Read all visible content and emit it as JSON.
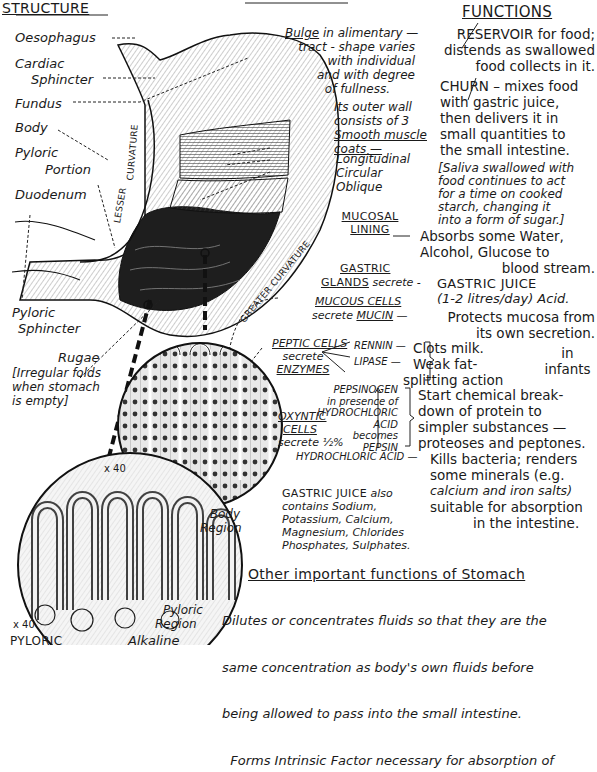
{
  "headings": {
    "structure": "STRUCTURE",
    "functions": "FUNCTIONS"
  },
  "structure_labels": {
    "oesophagus": "Oesophagus",
    "cardiac_1": "Cardiac",
    "cardiac_2": "Sphincter",
    "fundus": "Fundus",
    "body": "Body",
    "pyloric_portion_1": "Pyloric",
    "pyloric_portion_2": "Portion",
    "duodenum": "Duodenum",
    "pyloric_sphincter_1": "Pyloric",
    "pyloric_sphincter_2": "Sphincter",
    "rugae": "Rugae",
    "rugae_note": [
      "[Irregular folds",
      "when stomach",
      "is empty]"
    ],
    "lesser_curvature_1": "LESSER",
    "lesser_curvature_2": "CURVATURE",
    "greater_curvature": "GREATER CURVATURE"
  },
  "middle_notes": {
    "bulge": [
      "Bulge",
      " in alimentary —"
    ],
    "bulge_rest": [
      "tract - shape varies",
      "with individual",
      "and with degree",
      "of fullness."
    ],
    "outer_wall": [
      "Its outer wall",
      "consists of 3"
    ],
    "smooth_muscle": "Smooth muscle",
    "coats": "coats —",
    "layers": [
      "Longitudinal",
      "Circular",
      "Oblique"
    ],
    "mucosal_1": "MUCOSAL",
    "mucosal_2": "LINING",
    "gastric_1": "GASTRIC",
    "gastric_2": "GLANDS",
    "secrete": "secrete -",
    "mucous_cells": "MUCOUS CELLS",
    "secrete_mucin_1": "secrete",
    "secrete_mucin_2": "MUCIN",
    "peptic_1": "PEPTIC CELLS",
    "peptic_2": "secrete",
    "peptic_3": "ENZYMES",
    "rennin": "RENNIN —",
    "lipase": "LIPASE —",
    "pepsinogen": [
      "PEPSINOGEN",
      "in presence of",
      "HYDROCHLORIC",
      "ACID",
      "becomes",
      "PEPSIN"
    ],
    "oxyntic_1": "OXYNTIC",
    "oxyntic_2": "CELLS",
    "oxyntic_3": "secrete ½%",
    "hcl": "HYDROCHLORIC ACID —",
    "juice_contains_head": "GASTRIC JUICE",
    "juice_contains_also": "also",
    "juice_contains": [
      "contains Sodium,",
      "Potassium, Calcium,",
      "Magnesium, Chlorides",
      "Phosphates, Sulphates."
    ]
  },
  "functions": {
    "reservoir": [
      "RESERVOIR  for food;",
      "distends as swallowed",
      "food collects in it."
    ],
    "churn": [
      "CHURN – mixes food",
      "with  gastric juice,",
      "then delivers it in",
      "small quantities to",
      "the small intestine."
    ],
    "saliva": [
      "[Saliva swallowed with",
      "food continues  to act",
      "for a time on cooked",
      "starch, changing it",
      "into a form of sugar.]"
    ],
    "absorbs": [
      "Absorbs some Water,",
      "Alcohol, Glucose to",
      "blood stream."
    ],
    "gastric_juice": [
      "GASTRIC JUICE",
      "(1-2 litres/day) Acid."
    ],
    "protects": [
      "Protects mucosa from",
      "its own secretion."
    ],
    "clots": "Clots milk.",
    "weak_fat": [
      "Weak fat-",
      "splitting action"
    ],
    "infants": [
      "in",
      "infants"
    ],
    "protein": [
      "Start chemical  break-",
      "down of protein to",
      "simpler substances —",
      "proteoses and peptones."
    ],
    "kills": [
      "Kills bacteria; renders",
      "some minerals  (e.g.",
      "calcium and iron salts)",
      "suitable for absorption",
      "in the intestine."
    ]
  },
  "micro": {
    "magnification_1": "x 40",
    "body_region": [
      "Body",
      "Region"
    ],
    "magnification_2": "x 40",
    "pyloric_region": [
      "Pyloric",
      "Region"
    ],
    "pyloric_caps": "PYLORIC",
    "alkaline": "Alkaline"
  },
  "other_functions": {
    "title": "Other important functions of Stomach",
    "lines": [
      "Dilutes or concentrates fluids so that they are the",
      "same concentration as body's own fluids before",
      "being allowed to pass into the small intestine.",
      "  Forms Intrinsic Factor necessary for absorption of"
    ]
  }
}
